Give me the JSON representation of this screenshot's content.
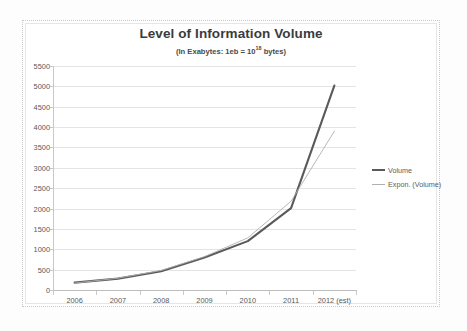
{
  "chart_data": {
    "type": "line",
    "title": "Level of Information Volume",
    "subtitle_prefix": "(In Exabytes: 1eb = 10",
    "subtitle_exponent": "18",
    "subtitle_suffix": " bytes)",
    "xlabel": "",
    "ylabel": "",
    "categories": [
      "2006",
      "2007",
      "2008",
      "2009",
      "2010",
      "2011",
      "2012 (est)"
    ],
    "ylim": [
      0,
      5500
    ],
    "ytick_labels": [
      "0",
      "500",
      "1000",
      "1500",
      "2000",
      "2500",
      "3000",
      "3500",
      "4000",
      "4500",
      "5000",
      "5500"
    ],
    "ytick_values": [
      0,
      500,
      1000,
      1500,
      2000,
      2500,
      3000,
      3500,
      4000,
      4500,
      5000,
      5500
    ],
    "grid": true,
    "legend_position": "right",
    "series": [
      {
        "name": "Volume",
        "style": "thick-solid",
        "color": "#5a5a5a",
        "values": [
          180,
          280,
          460,
          800,
          1200,
          2010,
          5020
        ]
      },
      {
        "name": "Expon. (Volume)",
        "style": "thin-solid",
        "color": "#b0b0b0",
        "values": [
          170,
          290,
          480,
          820,
          1280,
          2180,
          3900
        ]
      }
    ]
  },
  "legend": {
    "items": [
      {
        "label": "Volume"
      },
      {
        "label": "Expon. (Volume)"
      }
    ]
  },
  "colors": {
    "volume": "#5a5a5a",
    "trendline": "#b0b0b0",
    "gridline": "#e4e4e4",
    "axis": "#c9c9c9",
    "text": "#595959",
    "title": "#3b3b3b"
  }
}
